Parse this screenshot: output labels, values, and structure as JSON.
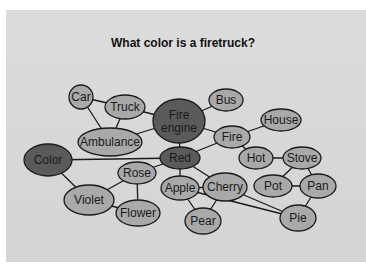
{
  "title": "What color is a firetruck?",
  "colors": {
    "background": "#d7d7d7",
    "node_light": "#a9a9a9",
    "node_dark": "#5a5a5a",
    "stroke": "#1a1a1a"
  },
  "nodes": [
    {
      "id": "car",
      "label": [
        "Car"
      ],
      "cx": 81,
      "cy": 97,
      "rx": 12,
      "ry": 12,
      "dark": false
    },
    {
      "id": "truck",
      "label": [
        "Truck"
      ],
      "cx": 125,
      "cy": 107,
      "rx": 20,
      "ry": 12,
      "dark": false
    },
    {
      "id": "fire-engine",
      "label": [
        "Fire",
        "engine"
      ],
      "cx": 179,
      "cy": 121,
      "rx": 26,
      "ry": 22,
      "dark": true
    },
    {
      "id": "bus",
      "label": [
        "Bus"
      ],
      "cx": 226,
      "cy": 100,
      "rx": 17,
      "ry": 11,
      "dark": false
    },
    {
      "id": "house",
      "label": [
        "House"
      ],
      "cx": 281,
      "cy": 120,
      "rx": 20,
      "ry": 11,
      "dark": false
    },
    {
      "id": "ambulance",
      "label": [
        "Ambulance"
      ],
      "cx": 110,
      "cy": 142,
      "rx": 32,
      "ry": 14,
      "dark": false
    },
    {
      "id": "fire",
      "label": [
        "Fire"
      ],
      "cx": 232,
      "cy": 137,
      "rx": 18,
      "ry": 11,
      "dark": false
    },
    {
      "id": "color",
      "label": [
        "Color"
      ],
      "cx": 48,
      "cy": 160,
      "rx": 24,
      "ry": 16,
      "dark": true
    },
    {
      "id": "red",
      "label": [
        "Red"
      ],
      "cx": 180,
      "cy": 158,
      "rx": 20,
      "ry": 11,
      "dark": true
    },
    {
      "id": "hot",
      "label": [
        "Hot"
      ],
      "cx": 256,
      "cy": 158,
      "rx": 17,
      "ry": 11,
      "dark": false
    },
    {
      "id": "stove",
      "label": [
        "Stove"
      ],
      "cx": 302,
      "cy": 158,
      "rx": 19,
      "ry": 11,
      "dark": false
    },
    {
      "id": "rose",
      "label": [
        "Rose"
      ],
      "cx": 137,
      "cy": 173,
      "rx": 19,
      "ry": 11,
      "dark": false
    },
    {
      "id": "apple",
      "label": [
        "Apple"
      ],
      "cx": 180,
      "cy": 188,
      "rx": 19,
      "ry": 12,
      "dark": false
    },
    {
      "id": "cherry",
      "label": [
        "Cherry"
      ],
      "cx": 225,
      "cy": 187,
      "rx": 22,
      "ry": 14,
      "dark": false
    },
    {
      "id": "pot",
      "label": [
        "Pot"
      ],
      "cx": 273,
      "cy": 186,
      "rx": 19,
      "ry": 11,
      "dark": false
    },
    {
      "id": "pan",
      "label": [
        "Pan"
      ],
      "cx": 318,
      "cy": 186,
      "rx": 18,
      "ry": 12,
      "dark": false
    },
    {
      "id": "violet",
      "label": [
        "Violet"
      ],
      "cx": 89,
      "cy": 200,
      "rx": 25,
      "ry": 15,
      "dark": false
    },
    {
      "id": "flower",
      "label": [
        "Flower"
      ],
      "cx": 138,
      "cy": 213,
      "rx": 22,
      "ry": 13,
      "dark": false
    },
    {
      "id": "pear",
      "label": [
        "Pear"
      ],
      "cx": 203,
      "cy": 221,
      "rx": 18,
      "ry": 13,
      "dark": false
    },
    {
      "id": "pie",
      "label": [
        "Pie"
      ],
      "cx": 298,
      "cy": 218,
      "rx": 18,
      "ry": 13,
      "dark": false
    }
  ],
  "edges": [
    [
      "car",
      "truck"
    ],
    [
      "car",
      "ambulance"
    ],
    [
      "truck",
      "ambulance"
    ],
    [
      "truck",
      "fire-engine"
    ],
    [
      "ambulance",
      "fire-engine"
    ],
    [
      "fire-engine",
      "bus"
    ],
    [
      "fire-engine",
      "fire"
    ],
    [
      "fire-engine",
      "red"
    ],
    [
      "fire",
      "house"
    ],
    [
      "fire",
      "red"
    ],
    [
      "fire",
      "hot"
    ],
    [
      "hot",
      "stove"
    ],
    [
      "stove",
      "pot"
    ],
    [
      "stove",
      "pan"
    ],
    [
      "pot",
      "pan"
    ],
    [
      "pan",
      "pie"
    ],
    [
      "color",
      "red"
    ],
    [
      "color",
      "violet"
    ],
    [
      "red",
      "rose"
    ],
    [
      "red",
      "apple"
    ],
    [
      "red",
      "cherry"
    ],
    [
      "rose",
      "violet"
    ],
    [
      "rose",
      "flower"
    ],
    [
      "violet",
      "flower"
    ],
    [
      "apple",
      "cherry"
    ],
    [
      "apple",
      "pear"
    ],
    [
      "cherry",
      "pear"
    ],
    [
      "apple",
      "pie"
    ],
    [
      "cherry",
      "pie"
    ]
  ]
}
